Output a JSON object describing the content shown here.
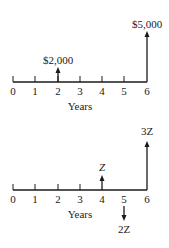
{
  "diagrams": [
    {
      "name": "cash-flow-top",
      "axis_label": "Years",
      "ticks": [
        "0",
        "1",
        "2",
        "3",
        "4",
        "5",
        "6"
      ],
      "flows": [
        {
          "year": 2,
          "label": "$2,000",
          "direction": "up"
        },
        {
          "year": 6,
          "label": "$5,000",
          "direction": "up"
        }
      ]
    },
    {
      "name": "cash-flow-bottom",
      "axis_label": "Years",
      "ticks": [
        "0",
        "1",
        "2",
        "3",
        "4",
        "5",
        "6"
      ],
      "flows": [
        {
          "year": 4,
          "label": "Z",
          "direction": "up"
        },
        {
          "year": 5,
          "label": "2Z",
          "direction": "down"
        },
        {
          "year": 6,
          "label": "3Z",
          "direction": "up"
        }
      ]
    }
  ]
}
